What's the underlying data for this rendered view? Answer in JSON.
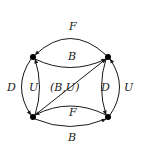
{
  "diagram": {
    "type": "directed-multigraph",
    "stroke_color": "#1a1a1a",
    "nodes": [
      {
        "id": "TL",
        "x": 33,
        "y": 57
      },
      {
        "id": "TR",
        "x": 108,
        "y": 57
      },
      {
        "id": "BL",
        "x": 33,
        "y": 117
      },
      {
        "id": "BR",
        "x": 108,
        "y": 117
      }
    ],
    "edges": [
      {
        "from": "TR",
        "to": "TL",
        "label": "F",
        "position": "top-outer"
      },
      {
        "from": "TL",
        "to": "TR",
        "label": "B",
        "position": "top-inner"
      },
      {
        "from": "TL",
        "to": "BL",
        "label": "D",
        "position": "left-outer"
      },
      {
        "from": "BL",
        "to": "TL",
        "label": "U",
        "position": "left-inner"
      },
      {
        "from": "BL",
        "to": "TR",
        "label": "(B,U)",
        "position": "diagonal"
      },
      {
        "from": "TR",
        "to": "BR",
        "label": "D",
        "position": "right-inner"
      },
      {
        "from": "BR",
        "to": "TR",
        "label": "U",
        "position": "right-outer"
      },
      {
        "from": "BR",
        "to": "BL",
        "label": "F",
        "position": "bottom-inner"
      },
      {
        "from": "BL",
        "to": "BR",
        "label": "B",
        "position": "bottom-outer"
      }
    ]
  },
  "labels": {
    "top_outer": "F",
    "top_inner": "B",
    "left_outer": "D",
    "left_inner": "U",
    "diagonal": "(B,U)",
    "right_inner": "D",
    "right_outer": "U",
    "bottom_inner": "F",
    "bottom_outer": "B"
  }
}
